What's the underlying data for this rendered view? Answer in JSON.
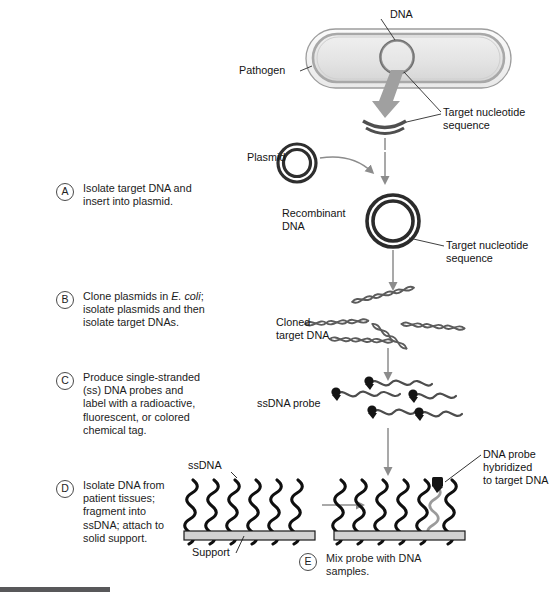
{
  "figure": {
    "background_color": "#ffffff",
    "ink_color": "#1a1a1a",
    "accent_gray": "#8a8a8a",
    "support_fill": "#d2d2d2"
  },
  "steps": [
    {
      "letter": "A",
      "text": "Isolate target DNA and\ninsert into plasmid."
    },
    {
      "letter": "B",
      "text_before": "Clone plasmids in ",
      "text_italic": "E. coli",
      "text_after": ";\nisolate plasmids and then\nisolate target DNAs."
    },
    {
      "letter": "C",
      "text": "Produce single-stranded\n(ss) DNA probes and\nlabel with a radioactive,\nfluorescent, or colored\nchemical tag."
    },
    {
      "letter": "D",
      "text": "Isolate DNA from\npatient tissues;\nfragment into\nssDNA; attach to\nsolid support."
    },
    {
      "letter": "E",
      "text": "Mix probe with DNA\nsamples."
    }
  ],
  "labels": {
    "dna": "DNA",
    "pathogen": "Pathogen",
    "target_nucleotide_sequence_top": "Target nucleotide\nsequence",
    "plasmid": "Plasmid",
    "recombinant_dna": "Recombinant\nDNA",
    "target_nucleotide_sequence_mid": "Target nucleotide\nsequence",
    "cloned_target_dna": "Cloned\ntarget DNA",
    "ssdna_probe": "ssDNA probe",
    "ssdna": "ssDNA",
    "support": "Support",
    "dna_probe_hybridized": "DNA probe\nhybridized\nto target DNA"
  },
  "icons": {
    "pathogen": "bacterium-capsule-icon",
    "dna_circle": "circular-dna-icon",
    "plasmid": "plasmid-ring-icon",
    "recombinant_plasmid": "recombinant-plasmid-ring-icon",
    "target_sequence_arc": "dna-arc-fragment-icon",
    "cloned_dna": "double-helix-icon",
    "probe_strand": "labeled-ssdna-probe-icon",
    "tag_dot": "chemical-tag-icon",
    "support_bar": "solid-support-bar-icon",
    "big_arrow": "thick-down-arrow-icon",
    "flow_arrow": "down-arrow-icon",
    "right_arrow": "right-arrow-icon",
    "curve_arrow": "curved-arrow-icon",
    "leader_line": "leader-line-icon"
  },
  "counts": {
    "ssdna_strands_left": 6,
    "ssdna_strands_right": 6,
    "hybridized_strand_index": 5,
    "cloned_dna_helices": 5,
    "probe_strands": 5
  }
}
